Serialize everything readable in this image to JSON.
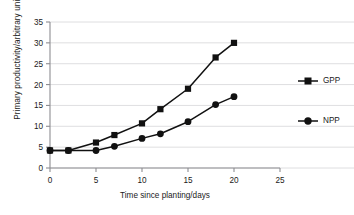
{
  "chart_data": {
    "type": "line",
    "title": "",
    "xlabel": "Time since planting/days",
    "ylabel": "Primary productivity/arbitrary units",
    "xlim": [
      0,
      25
    ],
    "ylim": [
      0,
      35
    ],
    "xticks": [
      0,
      5,
      10,
      15,
      20,
      25
    ],
    "yticks": [
      0,
      5,
      10,
      15,
      20,
      25,
      30,
      35
    ],
    "xtick_labels": [
      "0",
      "5",
      "10",
      "15",
      "20",
      "25"
    ],
    "ytick_labels": [
      "0",
      "5",
      "10",
      "15",
      "20",
      "25",
      "30",
      "35"
    ],
    "grid": "horizontal",
    "legend_position": "right",
    "x": [
      0,
      2,
      5,
      7,
      10,
      12,
      15,
      18,
      20
    ],
    "series": [
      {
        "name": "GPP",
        "marker": "square",
        "color": "#111111",
        "values": [
          4.2,
          4.2,
          6.1,
          7.9,
          10.7,
          14.1,
          19.0,
          26.5,
          30.0
        ]
      },
      {
        "name": "NPP",
        "marker": "circle",
        "color": "#111111",
        "values": [
          4.2,
          4.2,
          4.2,
          5.2,
          7.1,
          8.2,
          11.1,
          15.2,
          17.1
        ]
      }
    ]
  },
  "legend": {
    "entries": [
      {
        "label": "GPP",
        "marker": "square"
      },
      {
        "label": "NPP",
        "marker": "circle"
      }
    ]
  },
  "colors": {
    "ink": "#111111",
    "axis": "#8d8d92",
    "grid": "#d5d5d8",
    "background": "#ffffff"
  }
}
